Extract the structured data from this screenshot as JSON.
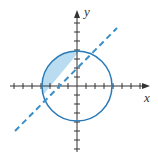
{
  "diagram": {
    "axes": {
      "x_label": "x",
      "y_label": "y",
      "tick_spacing": 1,
      "x_range": [
        -7,
        7
      ],
      "y_range": [
        -7,
        7
      ]
    },
    "circle": {
      "center": [
        0,
        0
      ],
      "radius": 4,
      "color": "#2a7ab8"
    },
    "line": {
      "equation": "y = x + 2",
      "style": "dashed",
      "color": "#3a8fc8"
    },
    "shaded_region": {
      "fill": "#b9dcf0",
      "description": "inside circle, above line"
    }
  }
}
